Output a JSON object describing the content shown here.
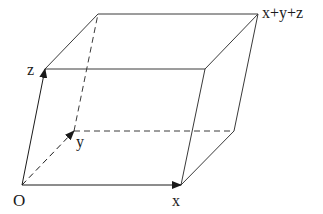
{
  "diagram": {
    "type": "parallelepiped-vector-addition",
    "labels": {
      "origin": "O",
      "x": "x",
      "y": "y",
      "z": "z",
      "sum": "x+y+z"
    },
    "colors": {
      "line": "#3a3a3a",
      "text": "#1a1a1a",
      "background": "#ffffff"
    },
    "vertices": {
      "O": [
        22,
        185
      ],
      "x": [
        181,
        185
      ],
      "y": [
        74,
        131
      ],
      "z": [
        45,
        69
      ],
      "x+y": [
        234,
        131
      ],
      "x+z": [
        205,
        69
      ],
      "y+z": [
        98,
        14
      ],
      "x+y+z": [
        258,
        14
      ]
    },
    "vectors": [
      {
        "from": "O",
        "to": "x",
        "style": "solid",
        "arrow": true
      },
      {
        "from": "O",
        "to": "y",
        "style": "dashed",
        "arrow": true
      },
      {
        "from": "O",
        "to": "z",
        "style": "solid",
        "arrow": true
      }
    ],
    "hidden_edges": [
      [
        "y",
        "x+y"
      ],
      [
        "y",
        "y+z"
      ]
    ]
  }
}
